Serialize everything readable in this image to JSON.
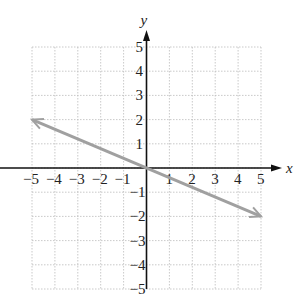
{
  "chart_data": {
    "type": "line",
    "title": "",
    "xlabel": "x",
    "ylabel": "y",
    "xlim": [
      -5,
      5
    ],
    "ylim": [
      -5,
      5
    ],
    "grid": true,
    "x_ticks": [
      "-5",
      "-4",
      "-3",
      "-2",
      "-1",
      "1",
      "2",
      "3",
      "4",
      "5"
    ],
    "y_ticks": [
      "5",
      "4",
      "3",
      "2",
      "1",
      "-1",
      "-2",
      "-3",
      "-4",
      "-5"
    ],
    "series": [
      {
        "name": "line",
        "x": [
          -5,
          5
        ],
        "y": [
          2,
          -2
        ],
        "color": "#a0a0a0",
        "arrows_both_ends": true
      }
    ]
  }
}
